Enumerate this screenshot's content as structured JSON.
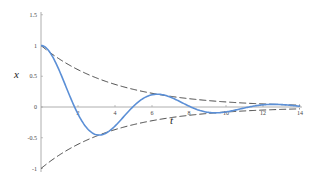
{
  "chart_data": {
    "type": "line",
    "title": "",
    "xlabel": "t",
    "ylabel": "x",
    "xlim": [
      0,
      14
    ],
    "ylim": [
      -1,
      1.5
    ],
    "grid": false,
    "legend": null,
    "x_ticks": [
      2,
      4,
      6,
      8,
      10,
      12,
      14
    ],
    "x_tick_labels": [
      "2",
      "4",
      "6",
      "8",
      "10",
      "12",
      "14"
    ],
    "y_ticks": [
      1.5,
      1,
      0.5,
      0,
      -0.5,
      -1
    ],
    "y_tick_labels": [
      "1.5",
      "1",
      "0.5",
      "0",
      "-0.5",
      "-1"
    ],
    "series": [
      {
        "name": "x(t) damped oscillation",
        "style": "solid",
        "color": "#5b8fd6",
        "formula": "exp(-t/4)*(cos(t)+0.25*sin(t))",
        "x": [
          0,
          1,
          1.9,
          2,
          3,
          3.35,
          4,
          5,
          5,
          6,
          6.6,
          7,
          8,
          9,
          9.7,
          10,
          11,
          12,
          13,
          14
        ],
        "y": [
          1.0,
          0.6,
          0.0,
          -0.03,
          -0.43,
          -0.45,
          -0.36,
          -0.02,
          -0.02,
          0.17,
          0.19,
          0.17,
          0.03,
          -0.09,
          -0.09,
          -0.08,
          -0.01,
          0.04,
          0.04,
          0.02
        ]
      },
      {
        "name": "upper envelope",
        "style": "dashed",
        "color": "#333333",
        "formula": "exp(-t/4)",
        "x": [
          0,
          2,
          4,
          6,
          8,
          10,
          12,
          14
        ],
        "y": [
          1.0,
          0.61,
          0.37,
          0.22,
          0.14,
          0.08,
          0.05,
          0.03
        ]
      },
      {
        "name": "lower envelope",
        "style": "dashed",
        "color": "#333333",
        "formula": "-exp(-t/4)",
        "x": [
          0,
          2,
          4,
          6,
          8,
          10,
          12,
          14
        ],
        "y": [
          -1.0,
          -0.61,
          -0.37,
          -0.22,
          -0.14,
          -0.08,
          -0.05,
          -0.03
        ]
      }
    ]
  },
  "labels": {
    "x_axis": "t",
    "y_axis": "x"
  },
  "colors": {
    "curve": "#5b8fd6",
    "envelope": "#333333",
    "axis": "#999999"
  }
}
